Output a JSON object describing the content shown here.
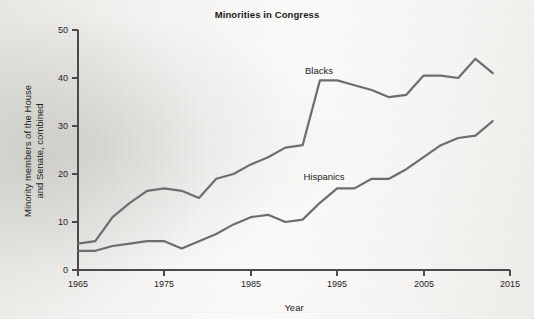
{
  "figure": {
    "title": "Minorities in Congress",
    "xlabel": "Year",
    "ylabel_line1": "Minority members of the House",
    "ylabel_line2": "and Senate, combined",
    "line_color": "#6d6d6d",
    "axis_color": "#4a4a4a",
    "text_color": "#1d1d1d",
    "background_color": "#f4f3f1"
  },
  "labels": {
    "blacks": "Blacks",
    "hispanics": "Hispanics"
  },
  "chart_data": {
    "type": "line",
    "title": "Minorities in Congress",
    "xlabel": "Year",
    "ylabel": "Minority members of the House and Senate, combined",
    "xlim": [
      1965,
      2015
    ],
    "ylim": [
      0,
      50
    ],
    "xticks": [
      1965,
      1975,
      1985,
      1995,
      2005,
      2015
    ],
    "yticks": [
      0,
      10,
      20,
      30,
      40,
      50
    ],
    "grid": false,
    "legend": "inline-annotations",
    "series": [
      {
        "name": "Blacks",
        "color": "#6d6d6d",
        "x": [
          1965,
          1967,
          1969,
          1971,
          1973,
          1975,
          1977,
          1979,
          1981,
          1983,
          1985,
          1987,
          1989,
          1991,
          1993,
          1995,
          1997,
          1999,
          2001,
          2003,
          2005,
          2007,
          2009,
          2011,
          2013
        ],
        "y": [
          5.5,
          6,
          11,
          14,
          16.5,
          17,
          16.5,
          15,
          19,
          20,
          22,
          23.5,
          25.5,
          26,
          39.5,
          39.5,
          38.5,
          37.5,
          36,
          36.5,
          40.5,
          40.5,
          40,
          44,
          41
        ]
      },
      {
        "name": "Hispanics",
        "color": "#6d6d6d",
        "x": [
          1965,
          1967,
          1969,
          1971,
          1973,
          1975,
          1977,
          1979,
          1981,
          1983,
          1985,
          1987,
          1989,
          1991,
          1993,
          1995,
          1997,
          1999,
          2001,
          2003,
          2005,
          2007,
          2009,
          2011,
          2013
        ],
        "y": [
          4,
          4,
          5,
          5.5,
          6,
          6,
          4.5,
          6,
          7.5,
          9.5,
          11,
          11.5,
          10,
          10.5,
          14,
          17,
          17,
          19,
          19,
          21,
          23.5,
          26,
          27.5,
          28,
          31
        ]
      }
    ],
    "annotations": [
      {
        "text": "Blacks",
        "x": 1990,
        "y": 45
      },
      {
        "text": "Hispanics",
        "x": 1988,
        "y": 21
      }
    ]
  }
}
